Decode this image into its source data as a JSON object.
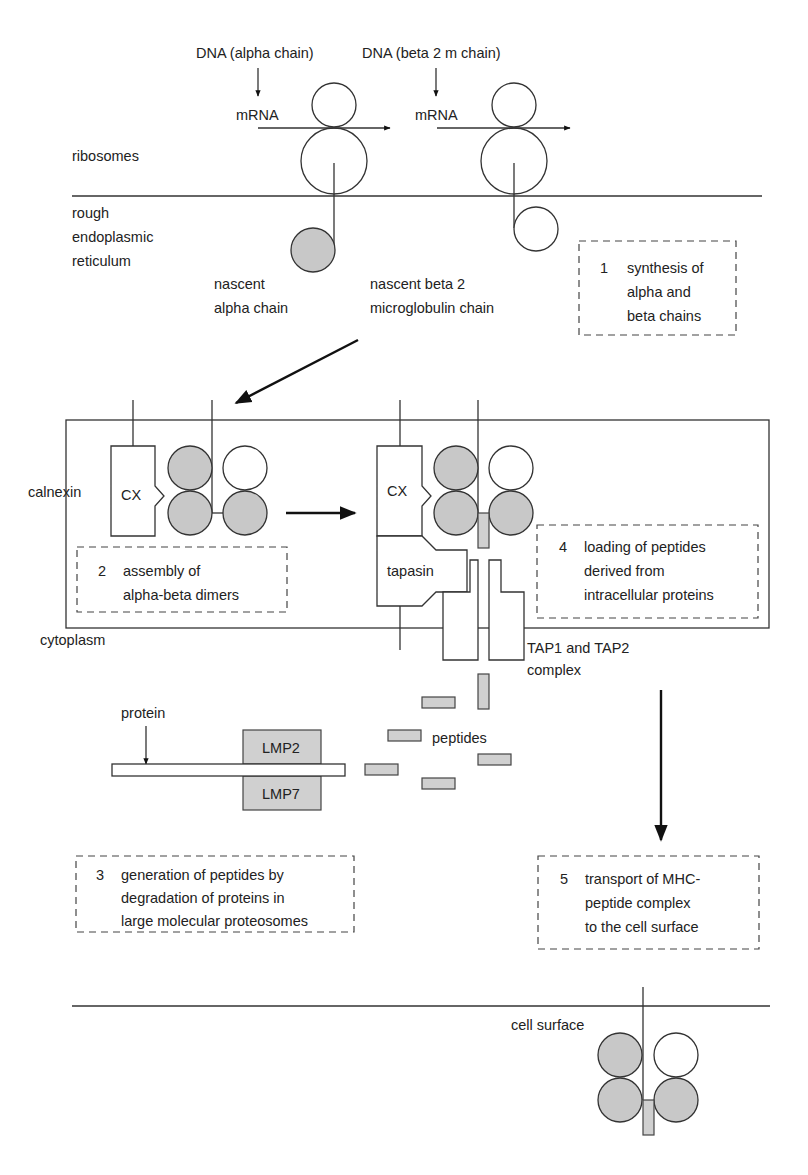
{
  "diagram": {
    "colors": {
      "line": "#333333",
      "shaded_domain": "#c8c8c8",
      "peptide": "#d0d0d0",
      "background": "#ffffff"
    },
    "top": {
      "dna_alpha": "DNA (alpha chain)",
      "dna_beta": "DNA (beta 2 m chain)",
      "mrna_1": "mRNA",
      "mrna_2": "mRNA",
      "ribosomes": "ribosomes",
      "rer_line1": "rough",
      "rer_line2": "endoplasmic",
      "rer_line3": "reticulum",
      "nascent_alpha_line1": "nascent",
      "nascent_alpha_line2": "alpha chain",
      "nascent_beta_line1": "nascent beta 2",
      "nascent_beta_line2": "microglobulin chain"
    },
    "er": {
      "calnexin": "calnexin",
      "cx_1": "CX",
      "cx_2": "CX",
      "tapasin": "tapasin",
      "cytoplasm": "cytoplasm",
      "tap_line1": "TAP1 and TAP2",
      "tap_line2": "complex"
    },
    "proteasome": {
      "protein": "protein",
      "lmp2": "LMP2",
      "lmp7": "LMP7",
      "peptides": "peptides"
    },
    "surface": {
      "cell_surface": "cell surface"
    },
    "steps": [
      {
        "number": "1",
        "lines": [
          "synthesis of",
          "alpha and",
          "beta chains"
        ]
      },
      {
        "number": "2",
        "lines": [
          "assembly of",
          "alpha-beta dimers"
        ]
      },
      {
        "number": "3",
        "lines": [
          "generation of peptides by",
          "degradation of proteins in",
          "large molecular proteosomes"
        ]
      },
      {
        "number": "4",
        "lines": [
          "loading of peptides",
          "derived from",
          "intracellular proteins"
        ]
      },
      {
        "number": "5",
        "lines": [
          "transport of MHC-",
          "peptide complex",
          "to the cell surface"
        ]
      }
    ]
  }
}
